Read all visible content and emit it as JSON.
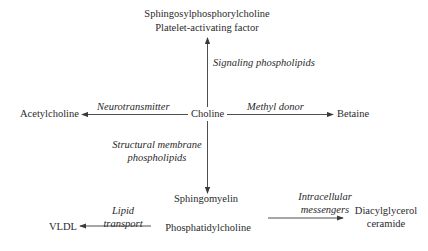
{
  "diagram": {
    "center": "Choline",
    "nodes": {
      "top_line1": "Sphingosylphosphorylcholine",
      "top_line2": "Platelet-activating factor",
      "left": "Acetylcholine",
      "right": "Betaine",
      "bottom": "Sphingomyelin",
      "phosphatidylcholine": "Phosphatidylcholine",
      "vldl": "VLDL",
      "dag_line1": "Diacylglycerol",
      "dag_line2": "ceramide"
    },
    "edge_labels": {
      "up": "Signaling phospholipids",
      "left": "Neurotransmitter",
      "right": "Methyl donor",
      "down_line1": "Structural membrane",
      "down_line2": "phospholipids",
      "lipid_line1": "Lipid",
      "lipid_line2": "transport",
      "intra_line1": "Intracellular",
      "intra_line2": "messengers"
    },
    "colors": {
      "line": "#3a3a3a",
      "text": "#2a2a2a"
    }
  }
}
